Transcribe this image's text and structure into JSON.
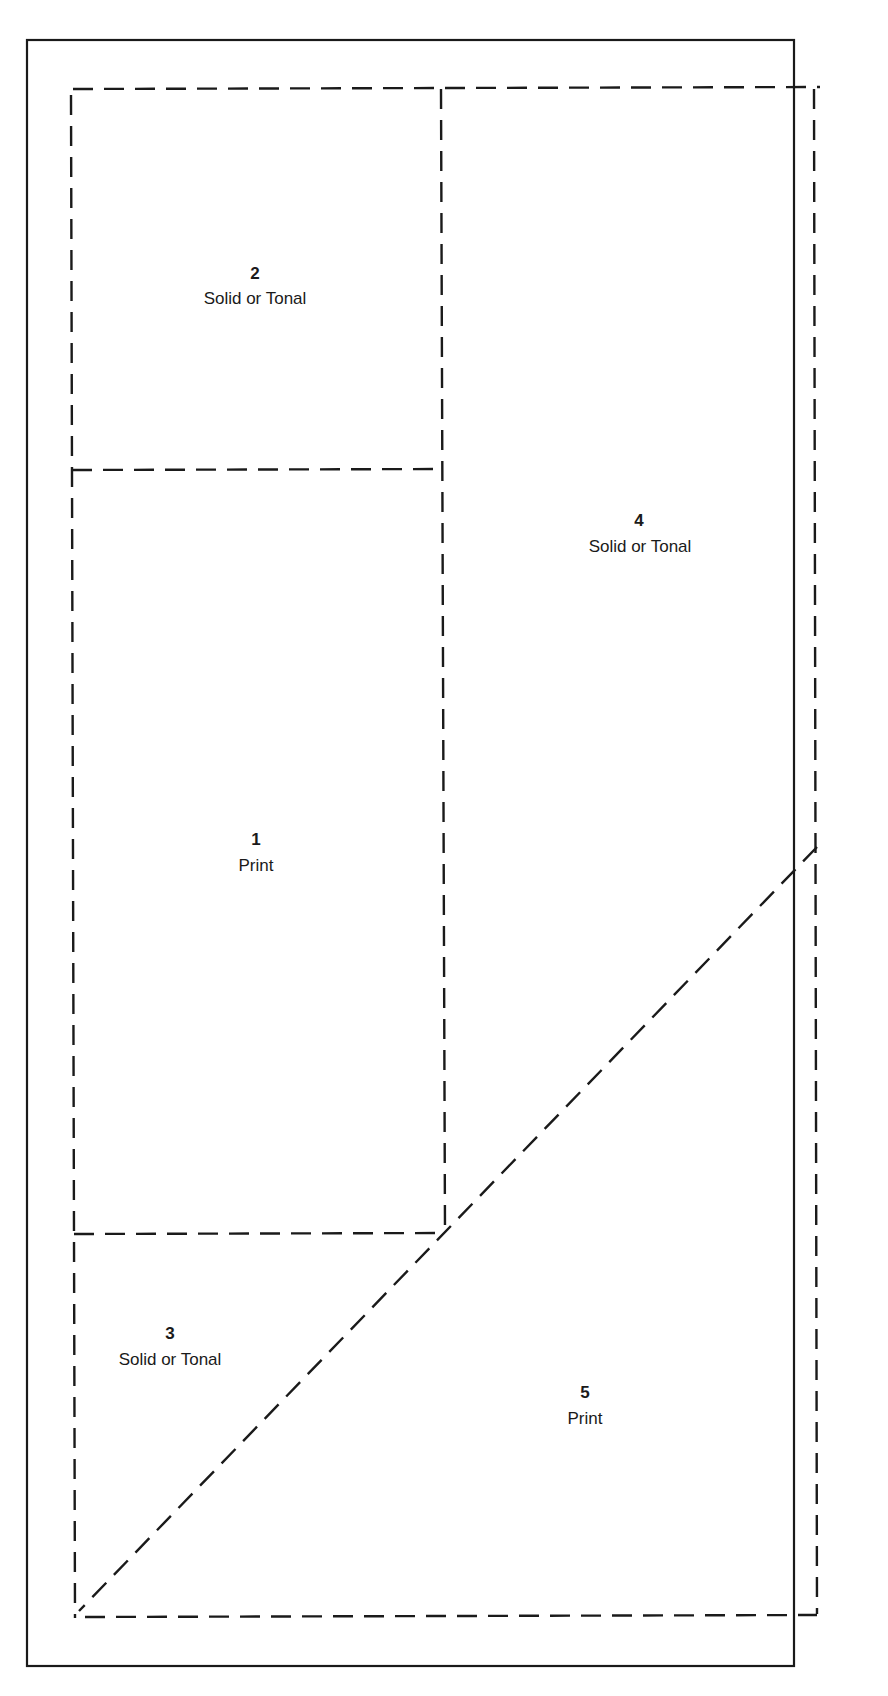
{
  "diagram": {
    "title": "",
    "regions": [
      {
        "id": "2",
        "number": "2",
        "label": "Solid or Tonal"
      },
      {
        "id": "4",
        "number": "4",
        "label": "Solid or Tonal"
      },
      {
        "id": "1",
        "number": "1",
        "label": "Print"
      },
      {
        "id": "3",
        "number": "3",
        "label": "Solid or Tonal"
      },
      {
        "id": "5",
        "number": "5",
        "label": "Print"
      }
    ],
    "line_styles": {
      "frame": "solid",
      "divisions": "dashed"
    },
    "colors": {
      "ink": "#1a1a1a",
      "background": "#ffffff"
    }
  }
}
